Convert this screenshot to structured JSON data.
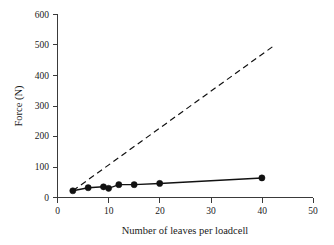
{
  "chart_data": {
    "type": "scatter",
    "title": "",
    "xlabel": "Number of leaves per loadcell",
    "ylabel": "Force (N)",
    "xlim": [
      0,
      50
    ],
    "ylim": [
      0,
      600
    ],
    "xticks": [
      0,
      10,
      20,
      30,
      40,
      50
    ],
    "yticks": [
      0,
      100,
      200,
      300,
      400,
      500,
      600
    ],
    "xtick_labels": [
      "0",
      "10",
      "20",
      "30",
      "40",
      "50"
    ],
    "ytick_labels": [
      "0",
      "100",
      "200",
      "300",
      "400",
      "500",
      "600"
    ],
    "grid": false,
    "legend": false,
    "legend_position": "none",
    "background_color": "#ffffff",
    "axis_color": "#3a3a3a",
    "series": [
      {
        "name": "Measured force",
        "style": "solid-with-markers",
        "color": "#111111",
        "marker": "filled-circle",
        "x": [
          3,
          6,
          9,
          10,
          12,
          15,
          20,
          40
        ],
        "values": [
          22,
          32,
          35,
          30,
          42,
          42,
          46,
          64
        ]
      },
      {
        "name": "Theoretical force",
        "style": "dashed",
        "color": "#111111",
        "marker": "none",
        "x": [
          3,
          42.5
        ],
        "values": [
          22,
          498
        ]
      }
    ]
  },
  "figure": {
    "xlabel_text": "Number of leaves per loadcell",
    "ylabel_text": "Force (N)"
  }
}
